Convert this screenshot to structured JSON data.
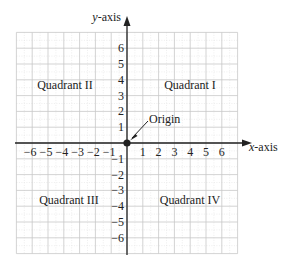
{
  "diagram": {
    "type": "coordinate-plane",
    "origin_px": [
      127,
      143
    ],
    "unit_px": 15.8,
    "extent_units": 7,
    "grid": {
      "major_color": "#c8c8c8",
      "minor_color": "#e2e2e2",
      "axis_color": "#222222"
    },
    "axes": {
      "x": {
        "label": "x-axis",
        "label_var": "x",
        "label_suffix": "-axis"
      },
      "y": {
        "label": "y-axis",
        "label_var": "y",
        "label_suffix": "-axis"
      }
    },
    "x_ticks": [
      {
        "value": -6,
        "label": "−6"
      },
      {
        "value": -5,
        "label": "−5"
      },
      {
        "value": -4,
        "label": "−4"
      },
      {
        "value": -3,
        "label": "−3"
      },
      {
        "value": -2,
        "label": "−2"
      },
      {
        "value": -1,
        "label": "−1"
      },
      {
        "value": 1,
        "label": "1"
      },
      {
        "value": 2,
        "label": "2"
      },
      {
        "value": 3,
        "label": "3"
      },
      {
        "value": 4,
        "label": "4"
      },
      {
        "value": 5,
        "label": "5"
      },
      {
        "value": 6,
        "label": "6"
      }
    ],
    "y_ticks": [
      {
        "value": 6,
        "label": "6"
      },
      {
        "value": 5,
        "label": "5"
      },
      {
        "value": 4,
        "label": "4"
      },
      {
        "value": 3,
        "label": "3"
      },
      {
        "value": 2,
        "label": "2"
      },
      {
        "value": 1,
        "label": "1"
      },
      {
        "value": -1,
        "label": "−1"
      },
      {
        "value": -2,
        "label": "−2"
      },
      {
        "value": -3,
        "label": "−3"
      },
      {
        "value": -4,
        "label": "−4"
      },
      {
        "value": -5,
        "label": "−5"
      },
      {
        "value": -6,
        "label": "−6"
      }
    ],
    "quadrants": [
      {
        "id": "I",
        "label": "Quadrant I"
      },
      {
        "id": "II",
        "label": "Quadrant II"
      },
      {
        "id": "III",
        "label": "Quadrant III"
      },
      {
        "id": "IV",
        "label": "Quadrant IV"
      }
    ],
    "origin": {
      "label": "Origin",
      "point_color": "#222222"
    }
  }
}
